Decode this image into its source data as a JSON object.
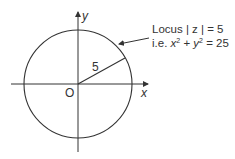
{
  "diagram": {
    "axis_x_label": "x",
    "axis_y_label": "y",
    "origin_label": "O",
    "radius_label": "5",
    "annotation_line1": "Locus | z | = 5",
    "annotation_line2_prefix": "i.e. ",
    "annotation_x": "x",
    "annotation_y": "y",
    "annotation_sup": "2",
    "annotation_plus": " + ",
    "annotation_eq": " = 25",
    "colors": {
      "stroke": "#333333",
      "text": "#333333"
    }
  }
}
